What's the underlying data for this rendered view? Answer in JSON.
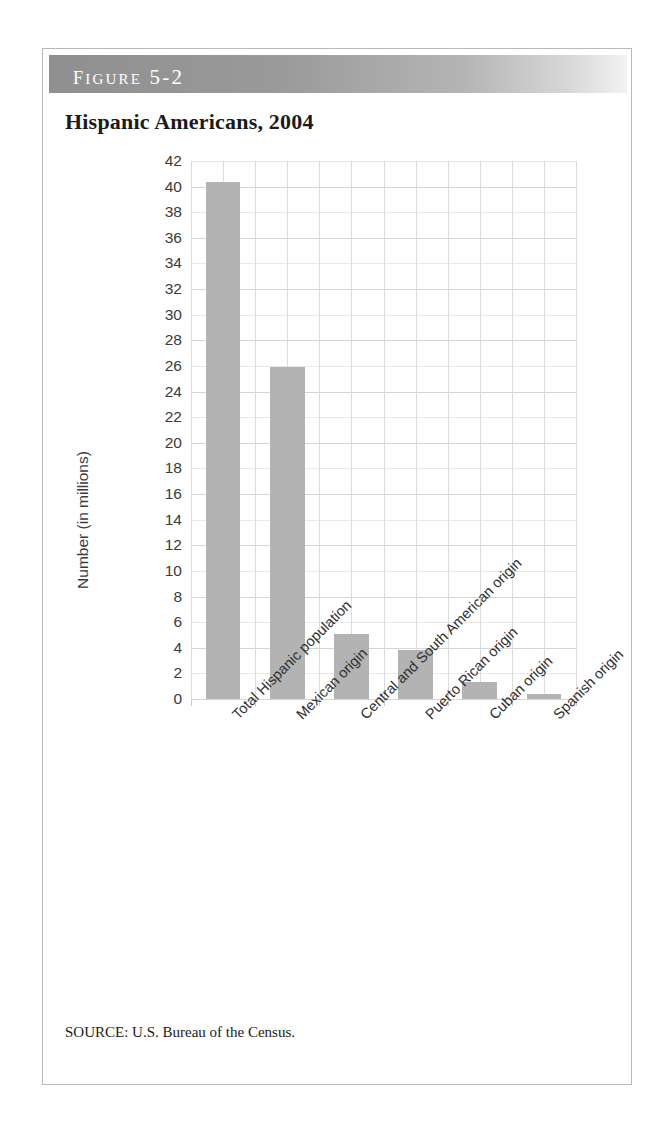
{
  "figure": {
    "banner_label": "Figure 5-2",
    "title": "Hispanic Americans, 2004",
    "source": "SOURCE: U.S. Bureau of the Census."
  },
  "colors": {
    "bar_fill": "#b3b3b3",
    "banner_start": "#8f8f8f",
    "banner_end": "#f2f2f2",
    "gridline": "#d5d5d5",
    "border": "#b9b9b9"
  },
  "chart_data": {
    "type": "bar",
    "title": "Hispanic Americans, 2004",
    "xlabel": "",
    "ylabel": "Number (in millions)",
    "ylim": [
      0,
      42
    ],
    "ytick_step": 2,
    "yticks": [
      0,
      2,
      4,
      6,
      8,
      10,
      12,
      14,
      16,
      18,
      20,
      22,
      24,
      26,
      28,
      30,
      32,
      34,
      36,
      38,
      40,
      42
    ],
    "ytick_labels": [
      "0",
      "2",
      "4",
      "6",
      "8",
      "10",
      "12",
      "14",
      "16",
      "18",
      "20",
      "22",
      "24",
      "26",
      "28",
      "30",
      "32",
      "34",
      "36",
      "38",
      "40",
      "42"
    ],
    "grid": true,
    "legend": false,
    "categories": [
      "Total Hispanic population",
      "Mexican origin",
      "Central and South American origin",
      "Puerto Rican origin",
      "Cuban origin",
      "Spanish origin"
    ],
    "values": [
      40.4,
      25.9,
      5.1,
      3.8,
      1.3,
      0.4
    ]
  }
}
